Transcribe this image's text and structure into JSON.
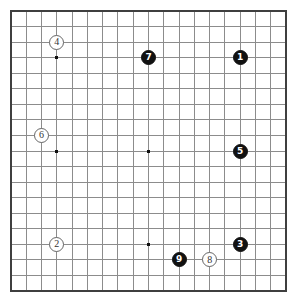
{
  "board": {
    "title": "Go board diagram",
    "size": 19,
    "columns": 19,
    "rows": 19,
    "background_color": "#ffffff",
    "grid_line_color": "#8c8c8c",
    "border_color": "#3f3f3f",
    "star_point_color": "#111111",
    "black_stone_color": "#111111",
    "white_stone_color": "#ffffff",
    "white_stone_border_color": "#666666",
    "geometry": {
      "left": 11,
      "top": 11,
      "right": 286,
      "bottom": 291,
      "cell_width": 15.28,
      "cell_height": 15.56
    },
    "star_points": [
      {
        "name": "star-point-upper-left",
        "col": 4,
        "row": 4
      },
      {
        "name": "star-point-upper-right",
        "col": 16,
        "row": 4
      },
      {
        "name": "star-point-lower-left",
        "col": 4,
        "row": 16
      },
      {
        "name": "star-point-lower-right",
        "col": 16,
        "row": 16
      },
      {
        "name": "star-point-center",
        "col": 10,
        "row": 10
      },
      {
        "name": "star-point-upper-side",
        "col": 10,
        "row": 4
      },
      {
        "name": "star-point-lower-side",
        "col": 10,
        "row": 16
      },
      {
        "name": "star-point-left-side",
        "col": 4,
        "row": 10
      },
      {
        "name": "star-point-right-side",
        "col": 16,
        "row": 10
      }
    ],
    "stones": [
      {
        "label": "1",
        "color": "black",
        "col": 16,
        "row": 4
      },
      {
        "label": "2",
        "color": "white",
        "col": 4,
        "row": 16
      },
      {
        "label": "3",
        "color": "black",
        "col": 16,
        "row": 16
      },
      {
        "label": "4",
        "color": "white",
        "col": 4,
        "row": 3
      },
      {
        "label": "5",
        "color": "black",
        "col": 16,
        "row": 10
      },
      {
        "label": "6",
        "color": "white",
        "col": 3,
        "row": 9
      },
      {
        "label": "7",
        "color": "black",
        "col": 10,
        "row": 4
      },
      {
        "label": "8",
        "color": "white",
        "col": 14,
        "row": 17
      },
      {
        "label": "9",
        "color": "black",
        "col": 12,
        "row": 17
      }
    ]
  }
}
